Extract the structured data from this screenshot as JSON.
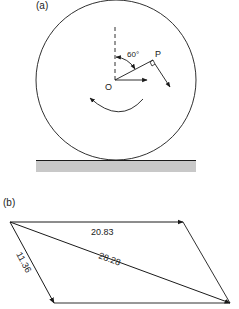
{
  "part_a": {
    "label": "(a)",
    "angle_label": "60°",
    "point_p_label": "P",
    "center_label": "O",
    "description": "Rolling wheel on ground with point P at 60° from vertical, rotation arrow"
  },
  "part_b": {
    "label": "(b)",
    "top_edge_value": "20.83",
    "left_edge_value": "11.36",
    "diagonal_value": "28.28",
    "description": "Parallelogram of velocity vectors"
  },
  "colors": {
    "stroke": "#1a1a1a",
    "ground_fill": "#c8c8c8",
    "background": "#ffffff"
  }
}
